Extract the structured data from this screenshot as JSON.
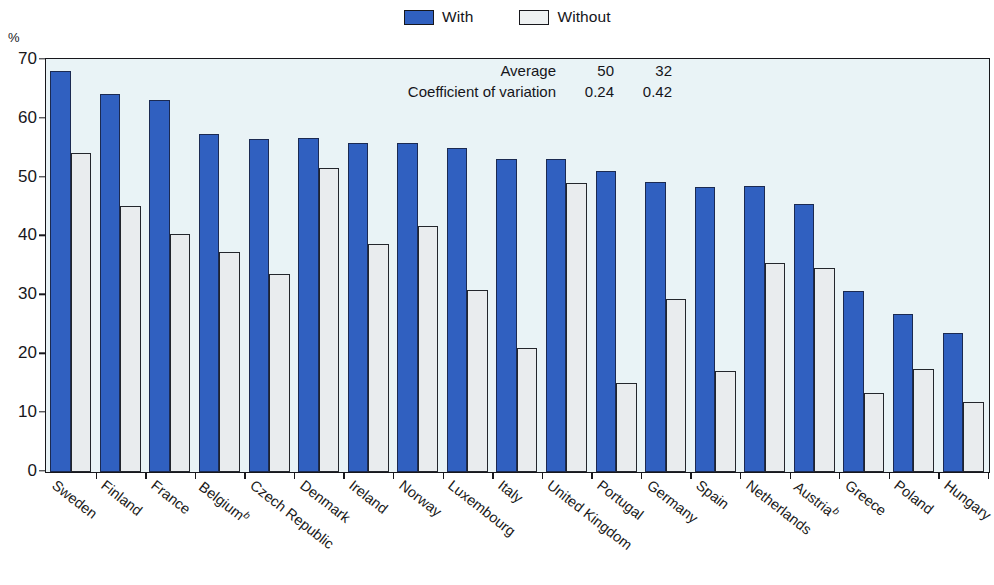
{
  "chart_data": {
    "type": "bar",
    "title": "",
    "xlabel": "",
    "ylabel": "%",
    "ylim": [
      0,
      70
    ],
    "yticks": [
      0,
      10,
      20,
      30,
      40,
      50,
      60,
      70
    ],
    "grid": false,
    "legend_position": "top-center",
    "categories": [
      "Sweden",
      "Finland",
      "France",
      "Belgiumᵇ",
      "Czech Republic",
      "Denmark",
      "Ireland",
      "Norway",
      "Luxembourg",
      "Italy",
      "United Kingdom",
      "Portugal",
      "Germany",
      "Spain",
      "Netherlands",
      "Austriaᵇ",
      "Greece",
      "Poland",
      "Hungary"
    ],
    "category_labels": [
      {
        "text": "Sweden",
        "sup": ""
      },
      {
        "text": "Finland",
        "sup": ""
      },
      {
        "text": "France",
        "sup": ""
      },
      {
        "text": "Belgium",
        "sup": "b"
      },
      {
        "text": "Czech Republic",
        "sup": ""
      },
      {
        "text": "Denmark",
        "sup": ""
      },
      {
        "text": "Ireland",
        "sup": ""
      },
      {
        "text": "Norway",
        "sup": ""
      },
      {
        "text": "Luxembourg",
        "sup": ""
      },
      {
        "text": "Italy",
        "sup": ""
      },
      {
        "text": "United Kingdom",
        "sup": ""
      },
      {
        "text": "Portugal",
        "sup": ""
      },
      {
        "text": "Germany",
        "sup": ""
      },
      {
        "text": "Spain",
        "sup": ""
      },
      {
        "text": "Netherlands",
        "sup": ""
      },
      {
        "text": "Austria",
        "sup": "b"
      },
      {
        "text": "Greece",
        "sup": ""
      },
      {
        "text": "Poland",
        "sup": ""
      },
      {
        "text": "Hungary",
        "sup": ""
      }
    ],
    "series": [
      {
        "name": "With",
        "color": "#3060c0",
        "values": [
          68.2,
          64.2,
          63.3,
          57.5,
          56.6,
          56.7,
          55.9,
          56.0,
          55.1,
          53.2,
          53.2,
          51.2,
          49.3,
          48.5,
          48.6,
          45.6,
          30.8,
          26.8,
          23.7
        ]
      },
      {
        "name": "Without",
        "color": "#e9ecee",
        "values": [
          54.3,
          45.2,
          40.4,
          37.4,
          33.7,
          51.6,
          38.8,
          41.9,
          31.0,
          21.0,
          49.1,
          15.1,
          29.4,
          17.2,
          35.6,
          34.6,
          13.5,
          17.5,
          11.9
        ]
      }
    ]
  },
  "legend": {
    "entries": [
      {
        "label": "With",
        "type": "with"
      },
      {
        "label": "Without",
        "type": "without"
      }
    ]
  },
  "annotation": {
    "rows": [
      {
        "name": "Average",
        "with": "50",
        "without": "32"
      },
      {
        "name": "Coefficient of variation",
        "with": "0.24",
        "without": "0.42"
      }
    ]
  },
  "axis": {
    "unit": "%"
  },
  "colors": {
    "with_bar": "#3060c0",
    "without_bar": "#e9ecee",
    "plot_background": "#e9f3f6",
    "frame": "#17171c"
  }
}
